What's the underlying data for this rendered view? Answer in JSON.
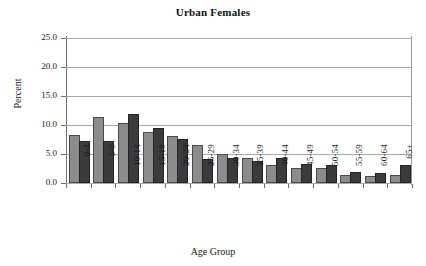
{
  "chart_data": {
    "type": "bar",
    "title": "Urban Females",
    "xlabel": "Age Group",
    "ylabel": "Percent",
    "categories": [
      "0-4",
      "5-9",
      "10-14",
      "15-19",
      "20-24",
      "25-29",
      "30-34",
      "35-39",
      "40-44",
      "45-49",
      "50-54",
      "55-59",
      "60-64",
      "65+"
    ],
    "series": [
      {
        "name": "series-1-light-gray",
        "color": "#8c8c8c",
        "values": [
          7.9,
          11.0,
          10.0,
          8.5,
          7.8,
          6.2,
          4.7,
          4.0,
          2.8,
          2.3,
          2.2,
          1.1,
          0.9,
          1.1
        ]
      },
      {
        "name": "series-2-dark-gray",
        "color": "#3b3b3b",
        "values": [
          6.9,
          6.9,
          11.5,
          9.2,
          7.2,
          3.8,
          3.9,
          3.4,
          3.9,
          3.0,
          2.8,
          1.5,
          1.3,
          2.8
        ]
      }
    ],
    "ylim": [
      0.0,
      25.0
    ],
    "ytick_labels": [
      "0.0",
      "5.0",
      "10.0",
      "15.0",
      "20.0",
      "25.0"
    ],
    "ytick_values": [
      0.0,
      5.0,
      10.0,
      15.0,
      20.0,
      25.0
    ],
    "grid": true,
    "grid_axis": "y",
    "legend": "none",
    "legend_position": "none"
  }
}
